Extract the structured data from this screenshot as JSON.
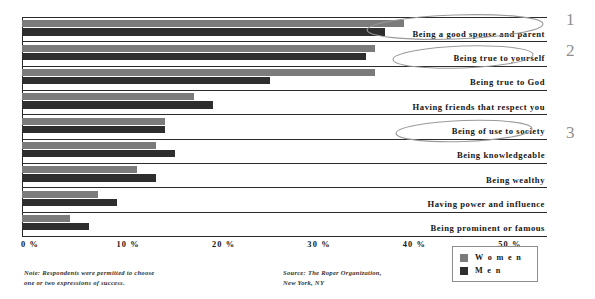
{
  "chart_data": {
    "type": "bar",
    "orientation": "horizontal",
    "title": "",
    "xlabel": "",
    "ylabel": "",
    "xlim": [
      0,
      55
    ],
    "xticks": [
      0,
      10,
      20,
      30,
      40,
      50
    ],
    "xtick_labels": [
      "0 %",
      "10 %",
      "20 %",
      "30 %",
      "40 %",
      "50 %"
    ],
    "grid": false,
    "legend_position": "bottom-right",
    "categories": [
      "Being a good spouse and parent",
      "Being true to yourself",
      "Being true to God",
      "Having friends that respect you",
      "Being of use to society",
      "Being knowledgeable",
      "Being wealthy",
      "Having power and influence",
      "Being prominent or famous"
    ],
    "series": [
      {
        "name": "Women",
        "color": "#7b7b7b",
        "values": [
          40,
          37,
          37,
          18,
          15,
          14,
          12,
          8,
          5
        ]
      },
      {
        "name": "Men",
        "color": "#2e2e2e",
        "values": [
          38,
          36,
          26,
          20,
          15,
          16,
          14,
          10,
          7
        ]
      }
    ],
    "note": "Note: Respondents were permitted to choose\none or two expressions of success.",
    "source": "Source: The Roper Organization,\n         New York, NY"
  },
  "legend": {
    "items": [
      {
        "label": "W o m e n",
        "color": "#7b7b7b"
      },
      {
        "label": "M e n",
        "color": "#2e2e2e"
      }
    ]
  },
  "annotations": [
    {
      "label": "1"
    },
    {
      "label": "2"
    },
    {
      "label": "3"
    }
  ]
}
